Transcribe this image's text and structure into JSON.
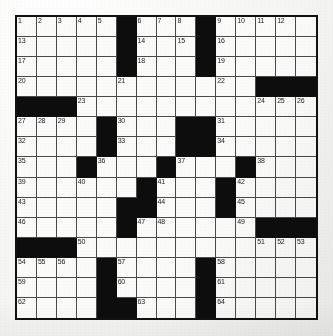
{
  "puzzle": {
    "title": "Crossword Puzzle Grid",
    "rows": 15,
    "cols": 15,
    "cell_size": 20.2,
    "colors": {
      "paper": "#f4f4f2",
      "cell_fill": "#fbfbf9",
      "block_fill": "#0d0d0d",
      "grid_line": "#4a4a4a",
      "border": "#111111",
      "number_text": "#1a1a1a"
    },
    "blocks": [
      [
        0,
        5
      ],
      [
        0,
        9
      ],
      [
        1,
        5
      ],
      [
        1,
        9
      ],
      [
        2,
        5
      ],
      [
        2,
        9
      ],
      [
        3,
        12
      ],
      [
        3,
        13
      ],
      [
        3,
        14
      ],
      [
        4,
        0
      ],
      [
        4,
        1
      ],
      [
        4,
        2
      ],
      [
        5,
        4
      ],
      [
        5,
        8
      ],
      [
        5,
        9
      ],
      [
        6,
        4
      ],
      [
        6,
        8
      ],
      [
        6,
        9
      ],
      [
        7,
        3
      ],
      [
        7,
        7
      ],
      [
        7,
        11
      ],
      [
        8,
        6
      ],
      [
        8,
        10
      ],
      [
        9,
        5
      ],
      [
        9,
        6
      ],
      [
        9,
        10
      ],
      [
        10,
        5
      ],
      [
        10,
        12
      ],
      [
        10,
        13
      ],
      [
        10,
        14
      ],
      [
        11,
        0
      ],
      [
        11,
        1
      ],
      [
        11,
        2
      ],
      [
        12,
        4
      ],
      [
        12,
        9
      ],
      [
        13,
        4
      ],
      [
        13,
        9
      ],
      [
        14,
        4
      ],
      [
        14,
        5
      ],
      [
        14,
        9
      ]
    ],
    "numbers": [
      {
        "row": 0,
        "col": 0,
        "n": "1"
      },
      {
        "row": 0,
        "col": 1,
        "n": "2"
      },
      {
        "row": 0,
        "col": 2,
        "n": "3"
      },
      {
        "row": 0,
        "col": 3,
        "n": "4"
      },
      {
        "row": 0,
        "col": 4,
        "n": "5"
      },
      {
        "row": 0,
        "col": 6,
        "n": "6"
      },
      {
        "row": 0,
        "col": 7,
        "n": "7"
      },
      {
        "row": 0,
        "col": 8,
        "n": "8"
      },
      {
        "row": 0,
        "col": 10,
        "n": "9"
      },
      {
        "row": 0,
        "col": 11,
        "n": "10"
      },
      {
        "row": 0,
        "col": 12,
        "n": "11"
      },
      {
        "row": 0,
        "col": 13,
        "n": "12"
      },
      {
        "row": 1,
        "col": 0,
        "n": "13"
      },
      {
        "row": 1,
        "col": 6,
        "n": "14"
      },
      {
        "row": 1,
        "col": 8,
        "n": "15"
      },
      {
        "row": 1,
        "col": 10,
        "n": "16"
      },
      {
        "row": 2,
        "col": 0,
        "n": "17"
      },
      {
        "row": 2,
        "col": 6,
        "n": "18"
      },
      {
        "row": 2,
        "col": 10,
        "n": "19"
      },
      {
        "row": 3,
        "col": 0,
        "n": "20"
      },
      {
        "row": 3,
        "col": 5,
        "n": "21"
      },
      {
        "row": 3,
        "col": 10,
        "n": "22"
      },
      {
        "row": 4,
        "col": 3,
        "n": "23"
      },
      {
        "row": 4,
        "col": 12,
        "n": "24"
      },
      {
        "row": 4,
        "col": 13,
        "n": "25"
      },
      {
        "row": 4,
        "col": 14,
        "n": "26"
      },
      {
        "row": 5,
        "col": 0,
        "n": "27"
      },
      {
        "row": 5,
        "col": 1,
        "n": "28"
      },
      {
        "row": 5,
        "col": 2,
        "n": "29"
      },
      {
        "row": 5,
        "col": 5,
        "n": "30"
      },
      {
        "row": 5,
        "col": 10,
        "n": "31"
      },
      {
        "row": 6,
        "col": 0,
        "n": "32"
      },
      {
        "row": 6,
        "col": 5,
        "n": "33"
      },
      {
        "row": 6,
        "col": 10,
        "n": "34"
      },
      {
        "row": 7,
        "col": 0,
        "n": "35"
      },
      {
        "row": 7,
        "col": 4,
        "n": "36"
      },
      {
        "row": 7,
        "col": 8,
        "n": "37"
      },
      {
        "row": 7,
        "col": 12,
        "n": "38"
      },
      {
        "row": 8,
        "col": 0,
        "n": "39"
      },
      {
        "row": 8,
        "col": 3,
        "n": "40"
      },
      {
        "row": 8,
        "col": 7,
        "n": "41"
      },
      {
        "row": 8,
        "col": 11,
        "n": "42"
      },
      {
        "row": 9,
        "col": 0,
        "n": "43"
      },
      {
        "row": 9,
        "col": 7,
        "n": "44"
      },
      {
        "row": 9,
        "col": 11,
        "n": "45"
      },
      {
        "row": 10,
        "col": 0,
        "n": "46"
      },
      {
        "row": 10,
        "col": 6,
        "n": "47"
      },
      {
        "row": 10,
        "col": 7,
        "n": "48"
      },
      {
        "row": 10,
        "col": 11,
        "n": "49"
      },
      {
        "row": 11,
        "col": 3,
        "n": "50"
      },
      {
        "row": 11,
        "col": 12,
        "n": "51"
      },
      {
        "row": 11,
        "col": 13,
        "n": "52"
      },
      {
        "row": 11,
        "col": 14,
        "n": "53"
      },
      {
        "row": 12,
        "col": 0,
        "n": "54"
      },
      {
        "row": 12,
        "col": 1,
        "n": "55"
      },
      {
        "row": 12,
        "col": 2,
        "n": "56"
      },
      {
        "row": 12,
        "col": 5,
        "n": "57"
      },
      {
        "row": 12,
        "col": 10,
        "n": "58"
      },
      {
        "row": 13,
        "col": 0,
        "n": "59"
      },
      {
        "row": 13,
        "col": 5,
        "n": "60"
      },
      {
        "row": 13,
        "col": 10,
        "n": "61"
      },
      {
        "row": 14,
        "col": 0,
        "n": "62"
      },
      {
        "row": 14,
        "col": 6,
        "n": "63"
      },
      {
        "row": 14,
        "col": 10,
        "n": "64"
      }
    ]
  }
}
